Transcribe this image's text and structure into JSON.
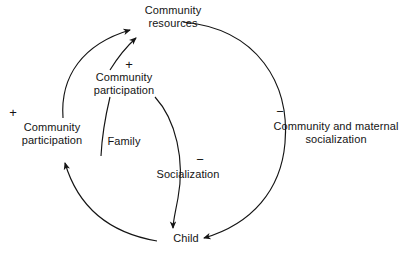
{
  "diagram": {
    "type": "causal-loop-diagram",
    "background_color": "#ffffff",
    "line_color": "#141414",
    "text_color": "#141414",
    "nodes": [
      {
        "id": "community-resources",
        "label": "Community\nresources"
      },
      {
        "id": "community-participation-inner",
        "label": "Community\nparticipation"
      },
      {
        "id": "community-participation-left",
        "label": "Community\nparticipation"
      },
      {
        "id": "community-and-maternal-socialization",
        "label": "Community and maternal\nsocialization"
      },
      {
        "id": "socialization",
        "label": "Socialization"
      },
      {
        "id": "family",
        "label": "Family"
      },
      {
        "id": "child",
        "label": "Child"
      }
    ],
    "signs": [
      {
        "id": "sign-community-participation-left",
        "symbol": "+"
      },
      {
        "id": "sign-community-participation-inner",
        "symbol": "+"
      },
      {
        "id": "sign-community-and-maternal-socialization",
        "symbol": "−"
      },
      {
        "id": "sign-socialization",
        "symbol": "−"
      }
    ],
    "edges": [
      {
        "id": "participation-to-resources-outer",
        "from": "community-participation-left",
        "to": "community-resources",
        "sign": "+",
        "arrowhead": true
      },
      {
        "id": "participation-to-resources-inner",
        "from": "community-participation-inner",
        "to": "community-resources",
        "sign": "+",
        "arrowhead": true
      },
      {
        "id": "resources-to-child-right",
        "from": "community-resources",
        "to": "child",
        "sign": "−",
        "arrowhead": true
      },
      {
        "id": "resources-to-child-socialization",
        "from": "community-resources",
        "to": "child",
        "sign": "−",
        "arrowhead": true
      },
      {
        "id": "child-to-participation-left",
        "from": "child",
        "to": "community-participation-left",
        "sign": "+",
        "arrowhead": true
      },
      {
        "id": "family-connector",
        "from": "family",
        "to": "community-participation-inner",
        "sign": "",
        "arrowhead": false
      }
    ]
  }
}
